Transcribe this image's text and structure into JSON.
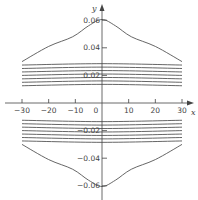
{
  "chart_data": {
    "type": "line",
    "title": "",
    "xlabel": "x",
    "ylabel": "y",
    "xlim": [
      -32,
      33
    ],
    "ylim": [
      -0.066,
      0.066
    ],
    "x_ticks": [
      -30,
      -20,
      -10,
      0,
      10,
      20,
      30
    ],
    "x_tick_labels": [
      "-30",
      "-20",
      "-10",
      "0",
      "10",
      "20",
      "30"
    ],
    "y_ticks": [
      0.06,
      0.04,
      0.02,
      -0.02,
      -0.04,
      -0.06
    ],
    "y_tick_labels": [
      "0.06",
      "0.04",
      "0.02",
      "-0.02",
      "-0.04",
      "-0.06"
    ],
    "grid": false,
    "legend": null,
    "colors": {
      "line": "#555555",
      "axis": "#444444"
    },
    "series": [
      {
        "name": "outer-upper",
        "x": [
          -30,
          -20,
          -11,
          -5,
          0,
          5,
          11,
          20,
          30
        ],
        "y": [
          0.03,
          0.041,
          0.048,
          0.056,
          0.0605,
          0.056,
          0.048,
          0.041,
          0.03
        ]
      },
      {
        "name": "band-upper-1",
        "x": [
          -30,
          0,
          30
        ],
        "y": [
          0.0275,
          0.0285,
          0.0275
        ]
      },
      {
        "name": "band-upper-2",
        "x": [
          -30,
          0,
          30
        ],
        "y": [
          0.025,
          0.026,
          0.025
        ]
      },
      {
        "name": "band-upper-3",
        "x": [
          -30,
          0,
          30
        ],
        "y": [
          0.0225,
          0.0235,
          0.0225
        ]
      },
      {
        "name": "band-upper-4",
        "x": [
          -30,
          0,
          30
        ],
        "y": [
          0.02,
          0.021,
          0.02
        ]
      },
      {
        "name": "band-upper-5",
        "x": [
          -30,
          0,
          30
        ],
        "y": [
          0.0175,
          0.0185,
          0.0175
        ]
      },
      {
        "name": "band-upper-6",
        "x": [
          -30,
          0,
          30
        ],
        "y": [
          0.015,
          0.016,
          0.015
        ]
      },
      {
        "name": "band-upper-7",
        "x": [
          -30,
          0,
          30
        ],
        "y": [
          0.0125,
          0.0135,
          0.0125
        ]
      },
      {
        "name": "band-lower-1",
        "x": [
          -30,
          0,
          30
        ],
        "y": [
          -0.0125,
          -0.0135,
          -0.0125
        ]
      },
      {
        "name": "band-lower-2",
        "x": [
          -30,
          0,
          30
        ],
        "y": [
          -0.015,
          -0.016,
          -0.015
        ]
      },
      {
        "name": "band-lower-3",
        "x": [
          -30,
          0,
          30
        ],
        "y": [
          -0.0175,
          -0.0185,
          -0.0175
        ]
      },
      {
        "name": "band-lower-4",
        "x": [
          -30,
          0,
          30
        ],
        "y": [
          -0.02,
          -0.021,
          -0.02
        ]
      },
      {
        "name": "band-lower-5",
        "x": [
          -30,
          0,
          30
        ],
        "y": [
          -0.0225,
          -0.0235,
          -0.0225
        ]
      },
      {
        "name": "band-lower-6",
        "x": [
          -30,
          0,
          30
        ],
        "y": [
          -0.025,
          -0.026,
          -0.025
        ]
      },
      {
        "name": "band-lower-7",
        "x": [
          -30,
          0,
          30
        ],
        "y": [
          -0.0275,
          -0.0285,
          -0.0275
        ]
      },
      {
        "name": "outer-lower",
        "x": [
          -30,
          -20,
          -11,
          -5,
          0,
          5,
          11,
          20,
          30
        ],
        "y": [
          -0.03,
          -0.041,
          -0.048,
          -0.056,
          -0.0605,
          -0.056,
          -0.048,
          -0.041,
          -0.03
        ]
      }
    ]
  }
}
